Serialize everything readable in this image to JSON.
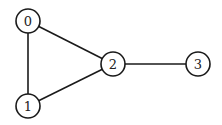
{
  "graph": {
    "type": "undirected",
    "nodes": [
      {
        "id": "0",
        "label": "0",
        "x": 28,
        "y": 21
      },
      {
        "id": "1",
        "label": "1",
        "x": 28,
        "y": 106
      },
      {
        "id": "2",
        "label": "2",
        "x": 113,
        "y": 64
      },
      {
        "id": "3",
        "label": "3",
        "x": 198,
        "y": 64
      }
    ],
    "edges": [
      {
        "from": "0",
        "to": "1"
      },
      {
        "from": "0",
        "to": "2"
      },
      {
        "from": "1",
        "to": "2"
      },
      {
        "from": "2",
        "to": "3"
      }
    ],
    "node_radius": 12,
    "stroke_color": "#1a1a1a",
    "fill_color": "#ffffff"
  }
}
